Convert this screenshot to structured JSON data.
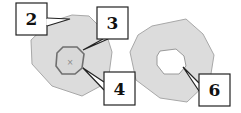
{
  "figure": {
    "colors": {
      "region_fill": "#dcdcdc",
      "region_stroke": "#a8a8a8",
      "inner_stroke": "#6f6f6f",
      "hole_fill": "#ffffff",
      "callout_stroke": "#222222",
      "callout_fill": "#ffffff"
    },
    "left_shape": {
      "outer_polygon": "50,22 72,15 89,16 106,33 112,52 108,82 82,96 52,86 32,64 31,40",
      "inner_polygon": "57,53 63,47 77,47 84,54 82,68 75,74 62,74 56,66",
      "center_marker": {
        "x": 70,
        "y": 62,
        "glyph": "×"
      }
    },
    "right_shape": {
      "outer_polygon": "152,26 186,19 203,34 214,55 210,80 187,102 160,98 136,80 130,52 138,35",
      "hole_polygon": "160,51 176,49 184,56 186,66 179,74 164,74 157,65 157,56"
    },
    "callouts": [
      {
        "label": "2",
        "box": {
          "x": 16,
          "y": 3,
          "w": 31,
          "h": 32
        },
        "tail": "47,18 70,19 47,26"
      },
      {
        "label": "3",
        "box": {
          "x": 97,
          "y": 7,
          "w": 31,
          "h": 32
        },
        "tail": "103,39 83,50 108,39"
      },
      {
        "label": "4",
        "box": {
          "x": 104,
          "y": 72,
          "w": 31,
          "h": 33
        },
        "tail": "104,82 83,68 104,90"
      },
      {
        "label": "6",
        "box": {
          "x": 199,
          "y": 74,
          "w": 31,
          "h": 32
        },
        "tail": "199,83 183,67 199,91"
      }
    ]
  }
}
